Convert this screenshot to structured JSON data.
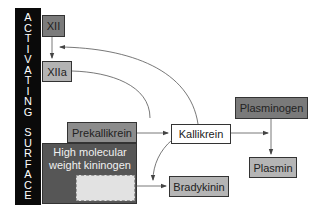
{
  "diagram": {
    "surface": {
      "label_line1": [
        "A",
        "C",
        "T",
        "I",
        "V",
        "A",
        "T",
        "I",
        "N",
        "G"
      ],
      "label_line2": [
        "S",
        "U",
        "R",
        "F",
        "A",
        "C",
        "E"
      ],
      "color": "#0a0a0a"
    },
    "nodes": {
      "xii": {
        "label": "XII",
        "color": "#7b7b7b"
      },
      "xiia": {
        "label": "XIIa",
        "color": "#b3b3b3"
      },
      "prekallikrein": {
        "label": "Prekallikrein",
        "color": "#8c8c8c"
      },
      "hmwk": {
        "label_line1": "High molecular",
        "label_line2": "weight kininogen",
        "color": "#565656"
      },
      "kallikrein": {
        "label": "Kallikrein",
        "color": "#ffffff"
      },
      "plasminogen": {
        "label": "Plasminogen",
        "color": "#7a7a7a"
      },
      "plasmin": {
        "label": "Plasmin",
        "color": "#b5b5b5"
      },
      "bradykinin": {
        "label": "Bradykinin",
        "color": "#b5b5b5"
      }
    },
    "edges": [
      {
        "from": "XII",
        "to": "XIIa",
        "type": "straight"
      },
      {
        "from": "XIIa",
        "to": "Prekallikrein→Kallikrein",
        "type": "curved"
      },
      {
        "from": "Kallikrein",
        "to": "XII→XIIa",
        "type": "curved-feedback"
      },
      {
        "from": "Prekallikrein",
        "to": "Kallikrein",
        "type": "straight"
      },
      {
        "from": "Kallikrein",
        "to": "Plasminogen→Plasmin",
        "type": "straight"
      },
      {
        "from": "Plasminogen",
        "to": "Plasmin",
        "type": "straight"
      },
      {
        "from": "Kallikrein",
        "to": "HMWK→Bradykinin",
        "type": "curved"
      },
      {
        "from": "High molecular weight kininogen",
        "to": "Bradykinin",
        "type": "straight"
      }
    ]
  }
}
